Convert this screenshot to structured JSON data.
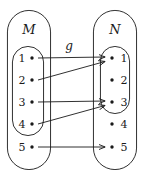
{
  "figure": {
    "type": "set-mapping-diagram",
    "width": 144,
    "height": 180,
    "stroke_color": "#1a1a1a",
    "background_color": "#ffffff",
    "mapping_label": "g",
    "sets": [
      {
        "id": "M",
        "name": "M",
        "side": "left",
        "label_position": "inside-left",
        "outer": {
          "x": 7,
          "y": 10,
          "width": 44,
          "height": 160,
          "rx": 22
        },
        "inner": {
          "x": 12,
          "y": 46,
          "width": 32,
          "height": 90,
          "rx": 16
        },
        "elements": [
          {
            "label": "1",
            "cx": 32,
            "cy": 58,
            "label_x": 22,
            "in_inner": true
          },
          {
            "label": "2",
            "cx": 32,
            "cy": 80,
            "label_x": 22,
            "in_inner": true
          },
          {
            "label": "3",
            "cx": 32,
            "cy": 102,
            "label_x": 22,
            "in_inner": true
          },
          {
            "label": "4",
            "cx": 32,
            "cy": 124,
            "label_x": 22,
            "in_inner": true
          },
          {
            "label": "5",
            "cx": 32,
            "cy": 147,
            "label_x": 22,
            "in_inner": false
          }
        ]
      },
      {
        "id": "N",
        "name": "N",
        "side": "right",
        "label_position": "inside-right",
        "outer": {
          "x": 93,
          "y": 10,
          "width": 44,
          "height": 160,
          "rx": 22
        },
        "inner": {
          "x": 100,
          "y": 46,
          "width": 30,
          "height": 68,
          "rx": 15
        },
        "elements": [
          {
            "label": "1",
            "cx": 112,
            "cy": 58,
            "label_x": 124,
            "in_inner": true
          },
          {
            "label": "2",
            "cx": 112,
            "cy": 80,
            "label_x": 124,
            "in_inner": true
          },
          {
            "label": "3",
            "cx": 112,
            "cy": 102,
            "label_x": 124,
            "in_inner": true
          },
          {
            "label": "4",
            "cx": 112,
            "cy": 124,
            "label_x": 124,
            "in_inner": false
          },
          {
            "label": "5",
            "cx": 112,
            "cy": 147,
            "label_x": 124,
            "in_inner": false
          }
        ]
      }
    ],
    "set_label_positions": {
      "M": {
        "x": 29,
        "y": 34
      },
      "N": {
        "x": 115,
        "y": 34
      }
    },
    "mapping_label_position": {
      "x": 69,
      "y": 50
    },
    "arrows": [
      {
        "from": "M1",
        "to": "N1",
        "x1": 38,
        "y1": 58,
        "x2": 105,
        "y2": 57
      },
      {
        "from": "M2",
        "to": "N1",
        "x1": 38,
        "y1": 80,
        "x2": 105,
        "y2": 61
      },
      {
        "from": "M3",
        "to": "N3",
        "x1": 38,
        "y1": 102,
        "x2": 105,
        "y2": 101
      },
      {
        "from": "M4",
        "to": "N3",
        "x1": 38,
        "y1": 124,
        "x2": 105,
        "y2": 105
      },
      {
        "from": "M5",
        "to": "N5",
        "x1": 38,
        "y1": 147,
        "x2": 105,
        "y2": 147
      }
    ]
  }
}
